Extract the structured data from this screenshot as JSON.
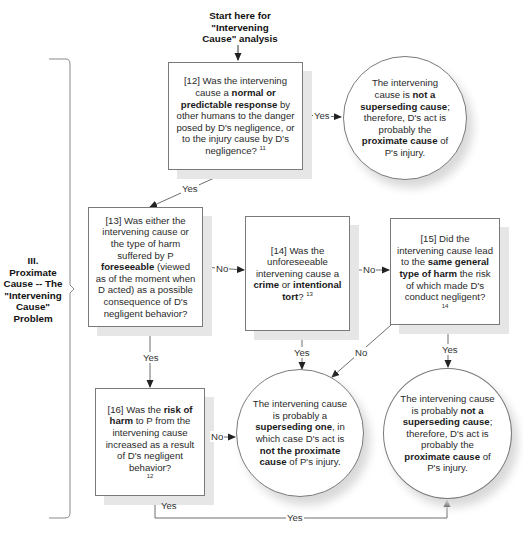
{
  "start": {
    "lines": [
      "Start here for",
      "\"Intervening",
      "Cause\" analysis"
    ]
  },
  "section": {
    "lines": [
      "III.",
      "Proximate",
      "Cause -- The",
      "\"Intervening",
      "Cause\"",
      "Problem"
    ]
  },
  "nodes": {
    "q12": {
      "pre": "[12] Was the intervening cause a ",
      "bold1": "normal or predictable response",
      "post": " by other humans to the danger posed by D's negligence, or to the injury cause by D's negligence?",
      "footnote": "11"
    },
    "q13": {
      "pre": "[13] Was either the intervening cause or the type of harm suffered by P ",
      "bold1": "foreseeable",
      "post": " (viewed as of the moment when D acted) as a possible consequence of D's negligent behavior?"
    },
    "q14": {
      "pre": "[14] Was the unforeseeable intervening cause a ",
      "bold1": "crime",
      "mid": " or ",
      "bold2": "intentional tort",
      "post": "?",
      "footnote": "13"
    },
    "q15": {
      "pre": "[15] Did the intervening cause lead to the ",
      "bold1": "same general type of harm",
      "post": " the risk of which made D's conduct negligent?",
      "footnote": "14"
    },
    "q16": {
      "pre": "[16] Was the ",
      "bold1": "risk of harm",
      "post": " to P from the intervening cause increased as a result of D's negligent behavior?",
      "footnote": "12"
    },
    "r1": {
      "pre": "The intervening cause is ",
      "bold1": "not a superseding cause",
      "mid": "; therefore, D's act is probably the ",
      "bold2": "proximate cause",
      "post": " of P's injury."
    },
    "r2": {
      "pre": "The intervening cause is probably a ",
      "bold1": "superseding one",
      "mid": ", in which case D's act is ",
      "bold2": "not the proximate cause",
      "post": " of P's injury."
    },
    "r3": {
      "pre": "The intervening cause is probably ",
      "bold1": "not a superseding cause",
      "mid": "; therefore, D's act is probably the ",
      "bold2": "proximate cause",
      "post": " of P's injury."
    }
  },
  "edges": {
    "q12_yes_r1": "Yes",
    "q12_yes_q13": "Yes",
    "q13_no_q14": "No",
    "q13_yes_q16": "Yes",
    "q14_no_q15": "No",
    "q14_yes_r2": "Yes",
    "q15_no_r2": "No",
    "q15_yes_r3": "Yes",
    "q16_no_r2": "No",
    "q16_yes_label": "Yes",
    "q16_yes_r3": "Yes"
  },
  "colors": {
    "line": "#6e6e6e",
    "border": "#7a7a7a",
    "shadow": "#e6e6e6"
  }
}
